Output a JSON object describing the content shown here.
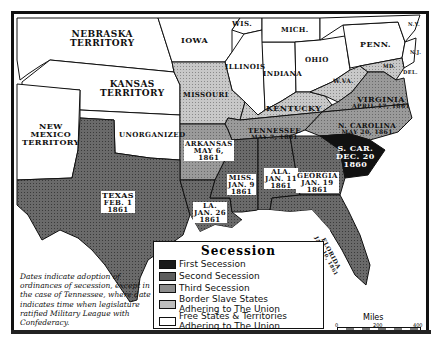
{
  "map": {
    "colors": {
      "first_secession": "#1a1a1a",
      "second_secession": "#5e5e5e",
      "third_secession": "#8c8c8c",
      "border_slave": "#bdbdbd",
      "free": "#ffffff",
      "border": "#111111"
    },
    "territories": {
      "nebraska": "NEBRASKA\nTERRITORY",
      "kansas": "KANSAS\nTERRITORY",
      "new_mexico": "NEW\nMEXICO\nTERRITORY",
      "unorganized": "UNORGANIZED"
    },
    "free_states": {
      "iowa": "IOWA",
      "wis": "WIS.",
      "mich": "MICH.",
      "illinois": "ILLINOIS",
      "indiana": "INDIANA",
      "ohio": "OHIO",
      "penn": "PENN.",
      "ny": "N.Y.",
      "nj": "N.J."
    },
    "border_states": {
      "missouri": "MISSOURI",
      "kentucky": "KENTUCKY",
      "wva": "W.VA.",
      "md": "MD.",
      "del": "DEL."
    },
    "seceded": {
      "sc": {
        "name": "S. CAR.",
        "date": "DEC. 20",
        "year": "1860"
      },
      "miss": {
        "name": "MISS.",
        "date": "JAN. 9",
        "year": "1861"
      },
      "fla": {
        "name": "FLORIDA",
        "date": "JAN. 10, 1861"
      },
      "ala": {
        "name": "ALA.",
        "date": "JAN. 11",
        "year": "1861"
      },
      "ga": {
        "name": "GEORGIA",
        "date": "JAN. 19",
        "year": "1861"
      },
      "la": {
        "name": "LA.",
        "date": "JAN. 26",
        "year": "1861"
      },
      "tex": {
        "name": "TEXAS",
        "date": "FEB. 1",
        "year": "1861"
      },
      "va": {
        "name": "VIRGINIA",
        "date": "APRIL 17, 1861"
      },
      "ark": {
        "name": "ARKANSAS",
        "date": "MAY 6,",
        "year": "1861"
      },
      "tenn": {
        "name": "TENNESSEE",
        "date": "MAY 7, 1861"
      },
      "nc": {
        "name": "N. CAROLINA",
        "date": "MAY 20, 1861"
      }
    }
  },
  "legend": {
    "title": "Secession",
    "items": [
      {
        "label": "First Secession",
        "label2": ""
      },
      {
        "label": "Second Secession",
        "label2": ""
      },
      {
        "label": "Third Secession",
        "label2": ""
      },
      {
        "label": "Border Slave States",
        "label2": "Adhering to The Union"
      },
      {
        "label": "Free States & Territories",
        "label2": "Adhering to The Union"
      }
    ]
  },
  "note": "Dates indicate adoption of ordinances of secession, except in the case of Tennessee, where date indicates time when legislature ratified Military League with Confederacy.",
  "scale": {
    "title": "Miles",
    "ticks": [
      "0",
      "200",
      "400"
    ]
  }
}
